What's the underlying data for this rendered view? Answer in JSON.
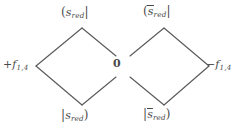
{
  "figure": {
    "type": "energy-level-diamond-diagram",
    "background_color": "#ffffff",
    "line_color": "#5a5a5a",
    "text_color": "#4a4a4a",
    "width": 240,
    "height": 131
  },
  "labels": {
    "top_left": {
      "open_bracket": "(",
      "symbol": "s",
      "subscript": "red",
      "close_bracket": "|",
      "overbar": false,
      "full_text": "(s_red|"
    },
    "top_right": {
      "open_bracket": "(",
      "symbol": "s",
      "subscript": "red",
      "close_bracket": "|",
      "overbar": true,
      "full_text": "(s̄_red|"
    },
    "bottom_left": {
      "open_bracket": "|",
      "symbol": "s",
      "subscript": "red",
      "close_bracket": ")",
      "overbar": false,
      "full_text": "|s_red)"
    },
    "bottom_right": {
      "open_bracket": "|",
      "symbol": "s",
      "subscript": "red",
      "close_bracket": ")",
      "overbar": true,
      "full_text": "|s̄_red)"
    },
    "left_energy": {
      "sign": "+",
      "symbol": "f",
      "subscript": "1,4",
      "full_text": "+f_1,4"
    },
    "right_energy": {
      "sign": "−",
      "symbol": "f",
      "subscript": "1,4",
      "full_text": "−f_1,4"
    },
    "center_zero": "0"
  },
  "geometry": {
    "left_diamond": {
      "top_vertex": [
        82,
        28
      ],
      "left_vertex": [
        36,
        66
      ],
      "bottom_vertex": [
        82,
        105
      ],
      "right_vertex": [
        128,
        66
      ],
      "right_vertex_open": true,
      "gap_px": 17
    },
    "right_diamond": {
      "top_vertex": [
        164,
        28
      ],
      "left_vertex": [
        117,
        66
      ],
      "bottom_vertex": [
        164,
        105
      ],
      "right_vertex": [
        209,
        66
      ],
      "left_vertex_open": true,
      "gap_px": 17
    }
  }
}
